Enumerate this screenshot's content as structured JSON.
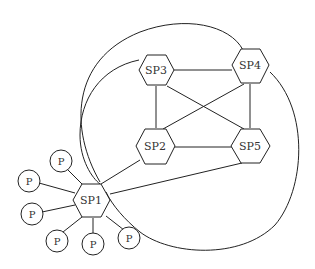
{
  "diagram": {
    "type": "network-topology",
    "colors": {
      "stroke": "#222222",
      "fill": "#ffffff",
      "text": "#333333"
    },
    "super_peers": [
      {
        "id": "SP1",
        "label": "SP1"
      },
      {
        "id": "SP2",
        "label": "SP2"
      },
      {
        "id": "SP3",
        "label": "SP3"
      },
      {
        "id": "SP4",
        "label": "SP4"
      },
      {
        "id": "SP5",
        "label": "SP5"
      }
    ],
    "peers": [
      {
        "id": "P1",
        "label": "P"
      },
      {
        "id": "P2",
        "label": "P"
      },
      {
        "id": "P3",
        "label": "P"
      },
      {
        "id": "P4",
        "label": "P"
      },
      {
        "id": "P5",
        "label": "P"
      },
      {
        "id": "P6",
        "label": "P"
      }
    ],
    "edges": [
      [
        "SP3",
        "SP4"
      ],
      [
        "SP3",
        "SP2"
      ],
      [
        "SP3",
        "SP5"
      ],
      [
        "SP4",
        "SP2"
      ],
      [
        "SP4",
        "SP5"
      ],
      [
        "SP2",
        "SP5"
      ],
      [
        "SP1",
        "SP2"
      ],
      [
        "SP1",
        "SP5"
      ],
      [
        "SP1",
        "SP3"
      ],
      [
        "SP1",
        "SP4"
      ],
      [
        "SP1",
        "P1"
      ],
      [
        "SP1",
        "P2"
      ],
      [
        "SP1",
        "P3"
      ],
      [
        "SP1",
        "P4"
      ],
      [
        "SP1",
        "P5"
      ],
      [
        "SP1",
        "P6"
      ]
    ]
  }
}
